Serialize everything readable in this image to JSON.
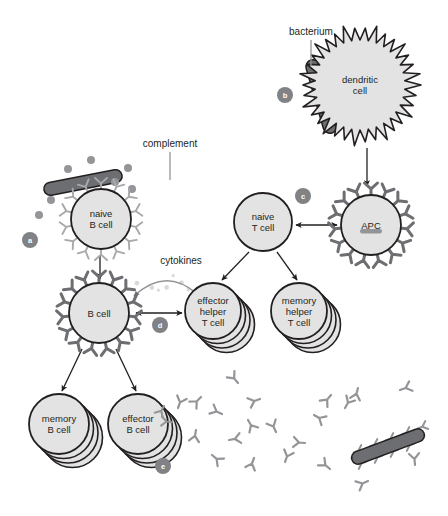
{
  "figure": {
    "background": "#ffffff",
    "width": 448,
    "height": 516
  },
  "palette": {
    "cell_fill": "#e3e3e3",
    "cell_stroke": "#231f20",
    "bacterium_fill": "#6d6e71",
    "bacterium_stroke": "#231f20",
    "receptor_light": "#a7a9ac",
    "receptor_dark": "#6d6e71",
    "complement_dot": "#939598",
    "antibody": "#939598",
    "marker_fill": "#808285",
    "marker_text": "#ffffff",
    "text": "#231f20",
    "arrow": "#231f20",
    "leader_line": "#939598"
  },
  "labels": {
    "bacterium": "bacterium",
    "complement": "complement",
    "cytokines": "cytokines"
  },
  "markers": [
    {
      "id": "a",
      "letter": "a",
      "x": 30,
      "y": 240,
      "r": 8
    },
    {
      "id": "b",
      "letter": "b",
      "x": 285,
      "y": 95,
      "r": 8
    },
    {
      "id": "c",
      "letter": "c",
      "x": 303,
      "y": 196,
      "r": 8
    },
    {
      "id": "d",
      "letter": "d",
      "x": 160,
      "y": 325,
      "r": 8
    },
    {
      "id": "e",
      "letter": "e",
      "x": 163,
      "y": 466,
      "r": 8
    }
  ],
  "cells": [
    {
      "id": "naive-b-cell",
      "name": "naive B cell",
      "lines": [
        "naive",
        "B cell"
      ],
      "cx": 101,
      "cy": 219,
      "r": 30,
      "style": "spiky-receptor-light",
      "stack": 1
    },
    {
      "id": "dendritic-cell",
      "name": "dendritic cell",
      "lines": [
        "dendritic",
        "cell"
      ],
      "cx": 360,
      "cy": 85,
      "r": 47,
      "style": "star-jagged",
      "stack": 1
    },
    {
      "id": "apc",
      "name": "APC",
      "lines": [
        "APC"
      ],
      "cx": 371,
      "cy": 225,
      "r": 30,
      "style": "mhc-receptor-dark",
      "stack": 1,
      "has_antigen_fragment": true
    },
    {
      "id": "naive-t-cell",
      "name": "naive T cell",
      "lines": [
        "naive",
        "T cell"
      ],
      "cx": 263,
      "cy": 222,
      "r": 29,
      "style": "plain",
      "stack": 1
    },
    {
      "id": "activated-b-cell",
      "name": "B cell",
      "lines": [
        "B cell"
      ],
      "cx": 99,
      "cy": 313,
      "r": 30,
      "style": "mhc-receptor-dark",
      "stack": 1
    },
    {
      "id": "effector-helper-t-cell",
      "name": "effector helper T cell",
      "lines": [
        "effector",
        "helper",
        "T cell"
      ],
      "cx": 213,
      "cy": 311,
      "r": 28,
      "style": "plain",
      "stack": 4
    },
    {
      "id": "memory-helper-t-cell",
      "name": "memory helper T cell",
      "lines": [
        "memory",
        "helper",
        "T cell"
      ],
      "cx": 299,
      "cy": 311,
      "r": 28,
      "style": "plain",
      "stack": 4
    },
    {
      "id": "memory-b-cell",
      "name": "memory B cell",
      "lines": [
        "memory",
        "B cell"
      ],
      "cx": 59,
      "cy": 424,
      "r": 30,
      "style": "plain",
      "stack": 4
    },
    {
      "id": "effector-b-cell",
      "name": "effector B cell",
      "lines": [
        "effector",
        "B cell"
      ],
      "cx": 138,
      "cy": 424,
      "r": 30,
      "style": "plain",
      "stack": 4,
      "secretes_antibodies": true
    }
  ],
  "bacteria": [
    {
      "id": "bacterium-free",
      "x1": 44,
      "y1": 190,
      "x2": 122,
      "y2": 175,
      "thickness": 13,
      "coated": false
    },
    {
      "id": "bacterium-dendritic",
      "x1": 311,
      "y1": 60,
      "x2": 332,
      "y2": 133,
      "thickness": 14,
      "coated": false
    },
    {
      "id": "bacterium-opsonized",
      "x1": 352,
      "y1": 460,
      "x2": 424,
      "y2": 433,
      "thickness": 13,
      "coated": true
    }
  ],
  "complement_dots": [
    {
      "x": 68,
      "y": 169
    },
    {
      "x": 91,
      "y": 160
    },
    {
      "x": 115,
      "y": 182
    },
    {
      "x": 132,
      "y": 189
    },
    {
      "x": 51,
      "y": 200
    },
    {
      "x": 39,
      "y": 215
    },
    {
      "x": 128,
      "y": 168
    }
  ],
  "arrows": [
    {
      "id": "dendritic-to-apc",
      "type": "single",
      "from": [
        367,
        148
      ],
      "to": [
        367,
        186
      ]
    },
    {
      "id": "tcell-apc-interaction",
      "type": "double",
      "from": [
        296,
        225
      ],
      "to": [
        337,
        225
      ]
    },
    {
      "id": "naive-b-to-b",
      "type": "single",
      "from": [
        100,
        255
      ],
      "to": [
        100,
        279
      ]
    },
    {
      "id": "tcell-to-effector-helper",
      "type": "single",
      "from": [
        249,
        252
      ],
      "to": [
        222,
        280
      ]
    },
    {
      "id": "tcell-to-memory-helper",
      "type": "single",
      "from": [
        277,
        252
      ],
      "to": [
        297,
        280
      ]
    },
    {
      "id": "bcell-to-memory-b",
      "type": "single",
      "from": [
        82,
        349
      ],
      "to": [
        62,
        391
      ]
    },
    {
      "id": "bcell-to-effector-b",
      "type": "single",
      "from": [
        116,
        349
      ],
      "to": [
        136,
        391
      ]
    },
    {
      "id": "bcell-thelper-interaction",
      "type": "double",
      "from": [
        136,
        313
      ],
      "to": [
        182,
        313
      ]
    },
    {
      "id": "cytokines-arc",
      "type": "curved",
      "from": [
        196,
        293
      ],
      "to": [
        134,
        296
      ]
    }
  ],
  "antibodies": [
    {
      "x": 178,
      "y": 408,
      "rot": 200
    },
    {
      "x": 201,
      "y": 397,
      "rot": 45
    },
    {
      "x": 222,
      "y": 414,
      "rot": 115
    },
    {
      "x": 196,
      "y": 430,
      "rot": 10
    },
    {
      "x": 229,
      "y": 440,
      "rot": 260
    },
    {
      "x": 248,
      "y": 420,
      "rot": 330
    },
    {
      "x": 260,
      "y": 399,
      "rot": 70
    },
    {
      "x": 276,
      "y": 432,
      "rot": 155
    },
    {
      "x": 254,
      "y": 458,
      "rot": 20
    },
    {
      "x": 285,
      "y": 462,
      "rot": 200
    },
    {
      "x": 305,
      "y": 443,
      "rot": 95
    },
    {
      "x": 314,
      "y": 415,
      "rot": 300
    },
    {
      "x": 331,
      "y": 395,
      "rot": 40
    },
    {
      "x": 330,
      "y": 469,
      "rot": 130
    },
    {
      "x": 345,
      "y": 408,
      "rot": 210
    },
    {
      "x": 358,
      "y": 388,
      "rot": 15
    },
    {
      "x": 368,
      "y": 481,
      "rot": 65
    },
    {
      "x": 400,
      "y": 390,
      "rot": 250
    },
    {
      "x": 415,
      "y": 465,
      "rot": 175
    },
    {
      "x": 238,
      "y": 383,
      "rot": 140
    },
    {
      "x": 212,
      "y": 455,
      "rot": 310
    }
  ]
}
